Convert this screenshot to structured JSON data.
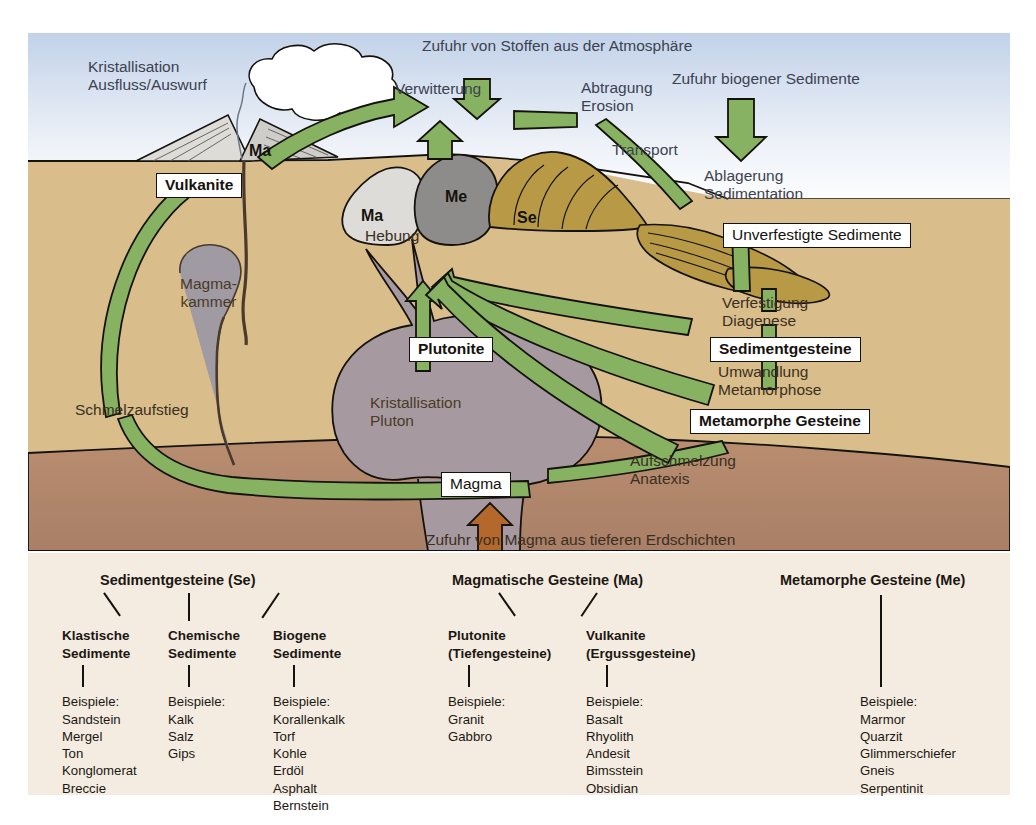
{
  "figure": {
    "title_internal": "Gesteinskreislauf",
    "colors": {
      "sky_top": "#c2d2e9",
      "sky_bottom": "#ffffff",
      "sea": "#a9b8d6",
      "ground": "#d9bd8b",
      "deep_earth": "#b58a6e",
      "pluton": "#a69aa0",
      "magma_chamber": "#a09aa2",
      "arrow_green": "#86b262",
      "arrow_brown": "#b5682c",
      "sediment_gold": "#b89a46",
      "rock_ma": "#d9d7d3",
      "rock_me": "#8e8c8a",
      "outline": "#15120e",
      "legend_bg": "#f4ece0"
    }
  },
  "diagram": {
    "process_labels": {
      "kristallisation_ausfluss": "Kristallisation\nAusfluss/Auswurf",
      "zufuhr_stoffe": "Zufuhr von Stoffen aus der Atmosphäre",
      "verwitterung": "Verwitterung",
      "abtragung_erosion": "Abtragung\nErosion",
      "zufuhr_biogener": "Zufuhr biogener Sedimente",
      "transport": "Transport",
      "ablagerung_sedimentation": "Ablagerung\nSedimentation",
      "verfestigung_diagenese": "Verfestigung\nDiagenese",
      "umwandlung_metamorphose": "Umwandlung\nMetamorphose",
      "hebung": "Hebung",
      "schmelzaufstieg": "Schmelzaufstieg",
      "magmakammer": "Magma-\nkammer",
      "kristallisation_pluton": "Kristallisation\nPluton",
      "aufschmelzung_anatexis": "Aufschmelzung\nAnatexis",
      "zufuhr_magma": "Zufuhr von Magma aus tieferen Erdschichten"
    },
    "boxed_labels": {
      "vulkanite": "Vulkanite",
      "plutonite": "Plutonite",
      "magma": "Magma",
      "unverfestigte_sedimente": "Unverfestigte Sedimente",
      "sedimentgesteine": "Sedimentgesteine",
      "metamorphe_gesteine": "Metamorphe Gesteine"
    },
    "rock_tags": {
      "ma_volcano": "Ma",
      "ma_block": "Ma",
      "me_block": "Me",
      "se_block": "Se"
    }
  },
  "legend": {
    "groups": [
      {
        "title": "Sedimentgesteine (Se)",
        "subgroups": [
          {
            "name": "Klastische\nSedimente",
            "examples_label": "Beispiele:",
            "examples": [
              "Sandstein",
              "Mergel",
              "Ton",
              "Konglomerat",
              "Breccie"
            ]
          },
          {
            "name": "Chemische\nSedimente",
            "examples_label": "Beispiele:",
            "examples": [
              "Kalk",
              "Salz",
              "Gips"
            ]
          },
          {
            "name": "Biogene\nSedimente",
            "examples_label": "Beispiele:",
            "examples": [
              "Korallenkalk",
              "Torf",
              "Kohle",
              "Erdöl",
              "Asphalt",
              "Bernstein"
            ]
          }
        ]
      },
      {
        "title": "Magmatische Gesteine (Ma)",
        "subgroups": [
          {
            "name": "Plutonite\n(Tiefengesteine)",
            "examples_label": "Beispiele:",
            "examples": [
              "Granit",
              "Gabbro"
            ]
          },
          {
            "name": "Vulkanite\n(Ergussgesteine)",
            "examples_label": "Beispiele:",
            "examples": [
              "Basalt",
              "Rhyolith",
              "Andesit",
              "Bimsstein",
              "Obsidian"
            ]
          }
        ]
      },
      {
        "title": "Metamorphe Gesteine (Me)",
        "subgroups": [
          {
            "name": "",
            "examples_label": "Beispiele:",
            "examples": [
              "Marmor",
              "Quarzit",
              "Glimmerschiefer",
              "Gneis",
              "Serpentinit"
            ]
          }
        ]
      }
    ]
  }
}
